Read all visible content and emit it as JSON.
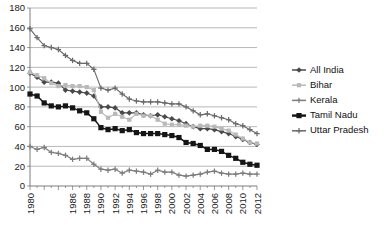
{
  "chart_data": {
    "type": "line",
    "title": "",
    "subtitle": "",
    "xlabel": "",
    "ylabel": "",
    "xlim": [
      1980,
      2012
    ],
    "ylim": [
      0,
      180
    ],
    "ytick_step": 20,
    "grid": true,
    "legend_position": "right",
    "yticks": [
      "0",
      "20",
      "40",
      "60",
      "80",
      "100",
      "120",
      "140",
      "160",
      "180"
    ],
    "x": [
      1980,
      1981,
      1982,
      1983,
      1984,
      1985,
      1986,
      1987,
      1988,
      1989,
      1990,
      1991,
      1992,
      1993,
      1994,
      1995,
      1996,
      1997,
      1998,
      1999,
      2000,
      2001,
      2002,
      2003,
      2004,
      2005,
      2006,
      2007,
      2008,
      2009,
      2010,
      2011,
      2012
    ],
    "xticks": [
      "1980",
      "1982",
      "1984",
      "1986",
      "1988",
      "1990",
      "1992",
      "1994",
      "1996",
      "1998",
      "2000",
      "2002",
      "2004",
      "2006",
      "2008",
      "2010",
      "2012"
    ],
    "xtick_labels_shown": [
      "1980",
      "1986",
      "1988",
      "1990",
      "1992",
      "1994",
      "1996",
      "1998",
      "2000",
      "2002",
      "2004",
      "2006",
      "2008",
      "2010",
      "2012"
    ],
    "series": [
      {
        "name": "All India",
        "color": "#4a4a4a",
        "marker": "diamond",
        "values": [
          114,
          110,
          105,
          105,
          104,
          97,
          96,
          95,
          94,
          91,
          80,
          80,
          79,
          74,
          74,
          74,
          72,
          71,
          72,
          70,
          68,
          66,
          63,
          60,
          58,
          58,
          57,
          55,
          53,
          50,
          47,
          44,
          42
        ]
      },
      {
        "name": "Bihar",
        "color": "#b9b9b9",
        "marker": "square",
        "values": [
          115,
          112,
          109,
          104,
          101,
          102,
          101,
          101,
          100,
          97,
          75,
          69,
          73,
          70,
          67,
          73,
          71,
          71,
          67,
          63,
          62,
          62,
          61,
          60,
          61,
          61,
          60,
          58,
          56,
          52,
          48,
          44,
          43
        ]
      },
      {
        "name": "Kerala",
        "color": "#7d7d7d",
        "marker": "cross",
        "values": [
          40,
          37,
          39,
          34,
          33,
          31,
          27,
          28,
          28,
          22,
          17,
          16,
          17,
          13,
          16,
          15,
          14,
          12,
          16,
          14,
          14,
          11,
          10,
          11,
          12,
          14,
          15,
          13,
          12,
          12,
          13,
          12,
          12
        ]
      },
      {
        "name": "Tamil Nadu",
        "color": "#151515",
        "marker": "square",
        "values": [
          93,
          91,
          84,
          81,
          80,
          81,
          79,
          76,
          74,
          68,
          59,
          57,
          58,
          56,
          57,
          54,
          53,
          53,
          53,
          52,
          51,
          49,
          44,
          43,
          41,
          37,
          37,
          35,
          31,
          28,
          24,
          22,
          21
        ]
      },
      {
        "name": "Uttar Pradesh",
        "color": "#6a6a6a",
        "marker": "cross",
        "values": [
          159,
          150,
          142,
          140,
          138,
          132,
          127,
          124,
          124,
          118,
          99,
          97,
          99,
          93,
          88,
          86,
          85,
          85,
          85,
          84,
          83,
          83,
          80,
          76,
          72,
          73,
          71,
          69,
          67,
          63,
          61,
          57,
          53
        ]
      }
    ]
  },
  "legend": {
    "items": [
      {
        "label": "All India"
      },
      {
        "label": "Bihar"
      },
      {
        "label": "Kerala"
      },
      {
        "label": "Tamil Nadu"
      },
      {
        "label": "Uttar Pradesh"
      }
    ]
  }
}
